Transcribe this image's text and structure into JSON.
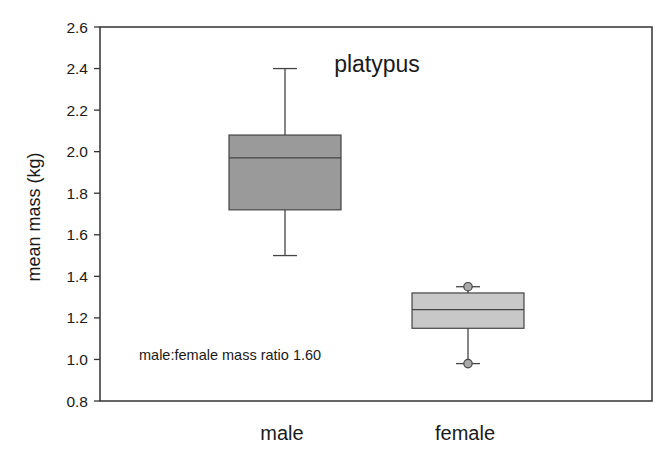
{
  "chart_data": {
    "type": "boxplot",
    "title": "platypus",
    "xlabel": "",
    "ylabel": "mean mass (kg)",
    "ylim": [
      0.8,
      2.6
    ],
    "yticks": [
      0.8,
      1.0,
      1.2,
      1.4,
      1.6,
      1.8,
      2.0,
      2.2,
      2.4,
      2.6
    ],
    "ytick_labels": [
      "0.8",
      "1.0",
      "1.2",
      "1.4",
      "1.6",
      "1.8",
      "2.0",
      "2.2",
      "2.4",
      "2.6"
    ],
    "categories": [
      "male",
      "female"
    ],
    "grid": false,
    "legend": null,
    "annotation": "male:female mass ratio 1.60",
    "series": [
      {
        "name": "male",
        "whisker_low": 1.5,
        "q1": 1.72,
        "median": 1.97,
        "q3": 2.08,
        "whisker_high": 2.4,
        "outliers": [],
        "color": "#9a9a9a"
      },
      {
        "name": "female",
        "whisker_low": 0.98,
        "q1": 1.15,
        "median": 1.24,
        "q3": 1.32,
        "whisker_high": 1.35,
        "outliers": [
          0.98,
          1.35
        ],
        "color": "#c8c8c8"
      }
    ]
  },
  "colors": {
    "axis": "#333333",
    "box_stroke": "#444444",
    "text": "#1a1a1a"
  }
}
